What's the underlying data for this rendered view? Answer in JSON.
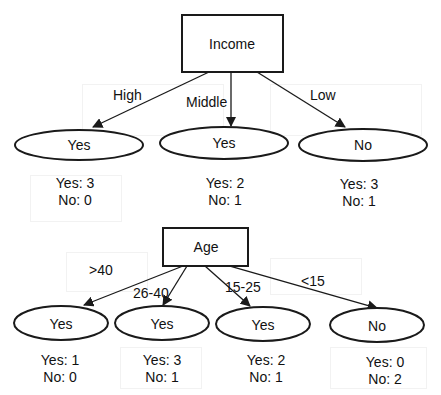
{
  "colors": {
    "stroke": "#1a1a1a",
    "text": "#111111",
    "background": "#ffffff"
  },
  "trees": [
    {
      "root": {
        "label": "Income"
      },
      "branches": [
        {
          "edge_label": "High",
          "leaf": "Yes",
          "counts": {
            "yes": "Yes: 3",
            "no": "No: 0"
          }
        },
        {
          "edge_label": "Middle",
          "leaf": "Yes",
          "counts": {
            "yes": "Yes: 2",
            "no": "No: 1"
          }
        },
        {
          "edge_label": "Low",
          "leaf": "No",
          "counts": {
            "yes": "Yes: 3",
            "no": "No: 1"
          }
        }
      ]
    },
    {
      "root": {
        "label": "Age"
      },
      "branches": [
        {
          "edge_label": ">40",
          "leaf": "Yes",
          "counts": {
            "yes": "Yes: 1",
            "no": "No: 0"
          }
        },
        {
          "edge_label": "26-40",
          "leaf": "Yes",
          "counts": {
            "yes": "Yes: 3",
            "no": "No: 1"
          }
        },
        {
          "edge_label": "15-25",
          "leaf": "Yes",
          "counts": {
            "yes": "Yes: 2",
            "no": "No: 1"
          }
        },
        {
          "edge_label": "<15",
          "leaf": "No",
          "counts": {
            "yes": "Yes: 0",
            "no": "No: 2"
          }
        }
      ]
    }
  ]
}
